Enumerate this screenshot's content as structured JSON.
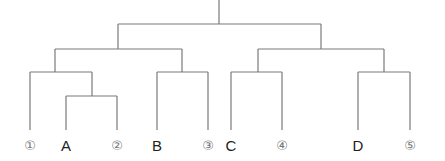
{
  "diagram": {
    "type": "tree-dendrogram",
    "line_color": "#7a7a7a",
    "leaves": [
      {
        "id": "n1",
        "label": "①",
        "kind": "num",
        "x": 30
      },
      {
        "id": "A",
        "label": "A",
        "kind": "letter",
        "x": 66
      },
      {
        "id": "n2",
        "label": "②",
        "kind": "num",
        "x": 117
      },
      {
        "id": "B",
        "label": "B",
        "kind": "letter",
        "x": 157
      },
      {
        "id": "n3",
        "label": "③",
        "kind": "num",
        "x": 208
      },
      {
        "id": "C",
        "label": "C",
        "kind": "letter",
        "x": 231
      },
      {
        "id": "n4",
        "label": "④",
        "kind": "num",
        "x": 282
      },
      {
        "id": "D",
        "label": "D",
        "kind": "letter",
        "x": 358
      },
      {
        "id": "n5",
        "label": "⑤",
        "kind": "num",
        "x": 410
      }
    ],
    "structure": "((①,(A,②)),(B,③)),((C,④),(D,⑤))"
  }
}
